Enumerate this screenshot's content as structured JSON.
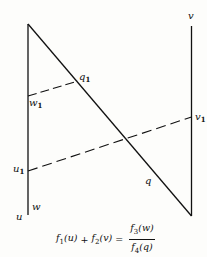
{
  "diagram": {
    "type": "nomogram",
    "scales": [
      {
        "name": "u-w scale (left)",
        "top_label": "",
        "bottom_label": "u",
        "inner_label": "w"
      },
      {
        "name": "v scale (right)",
        "top_label": "v"
      },
      {
        "name": "q scale (diagonal)",
        "label": "q"
      }
    ],
    "labels": {
      "v": "v",
      "q1": "q",
      "q1_sub": "1",
      "w1": "w",
      "w1_sub": "1",
      "v1": "v",
      "v1_sub": "1",
      "u1": "u",
      "u1_sub": "1",
      "q": "q",
      "w": "w",
      "u": "u"
    },
    "isopleths": [
      {
        "from": "w1",
        "to": "q1",
        "style": "dashed"
      },
      {
        "from": "u1",
        "to": "v1",
        "style": "dashed"
      }
    ],
    "formula": {
      "lhs_f1": "f",
      "lhs_f1_sub": "1",
      "lhs_f1_arg": "(u)",
      "plus": "+",
      "lhs_f2": "f",
      "lhs_f2_sub": "2",
      "lhs_f2_arg": "(v)",
      "equals": "=",
      "num_f": "f",
      "num_sub": "3",
      "num_arg": "(w)",
      "den_f": "f",
      "den_sub": "4",
      "den_arg": "(q)"
    }
  }
}
